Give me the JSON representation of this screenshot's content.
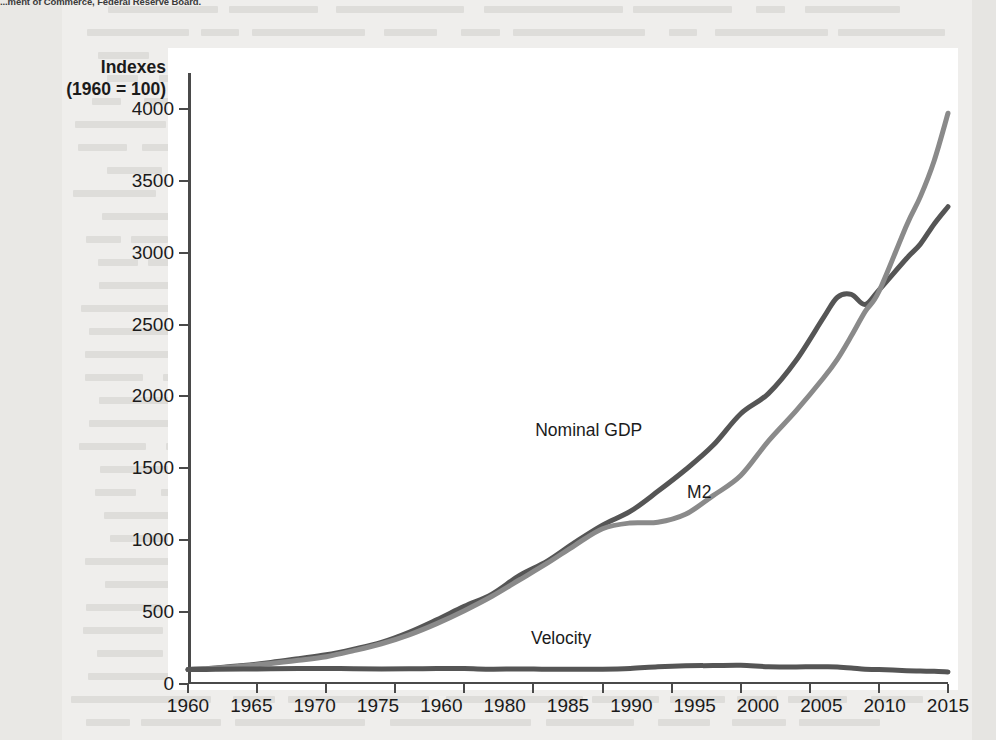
{
  "source_note": "...ment of Commerce, Federal Reserve Board.",
  "axis_caption": {
    "line1": "Indexes",
    "line2": "(1960 = 100)"
  },
  "colors": {
    "nominal_gdp": "#555555",
    "m2": "#8a8a8a",
    "velocity": "#555555",
    "axis": "#4a4a4a",
    "text": "#1b1b1b",
    "plate": "#ffffff",
    "page": "#efeeec"
  },
  "annotations": [
    {
      "name": "nominal-gdp-label",
      "text": "Nominal GDP",
      "x": 1989.0,
      "y": 1770
    },
    {
      "name": "m2-label",
      "text": "M2",
      "x": 1997.0,
      "y": 1335
    },
    {
      "name": "velocity-label",
      "text": "Velocity",
      "x": 1987.0,
      "y": 320
    }
  ],
  "chart_data": {
    "type": "line",
    "title": "",
    "subtitle": "",
    "xlabel": "",
    "ylabel": "Indexes (1960 = 100)",
    "xlim": [
      1960,
      2015
    ],
    "ylim": [
      0,
      4250
    ],
    "grid": false,
    "legend": "inline-annotations",
    "ytick_labels": [
      "0",
      "500",
      "1000",
      "1500",
      "2000",
      "2500",
      "3000",
      "3500",
      "4000"
    ],
    "yticks": [
      0,
      500,
      1000,
      1500,
      2000,
      2500,
      3000,
      3500,
      4000
    ],
    "xtick_labels": [
      "1960",
      "1965",
      "1970",
      "1975",
      "1960",
      "1980",
      "1985",
      "1990",
      "1995",
      "2000",
      "2005",
      "2010",
      "2015"
    ],
    "xticks": [
      1960,
      1965,
      1970,
      1975,
      1980,
      1985,
      1990,
      1995,
      2000,
      2005,
      2010,
      2015
    ],
    "xtick_note": "The fifth tick label is printed as 1960 in the source figure (apparent typo for an intermediate year).",
    "x": [
      1960,
      1962,
      1964,
      1966,
      1968,
      1970,
      1972,
      1974,
      1976,
      1978,
      1980,
      1982,
      1984,
      1986,
      1988,
      1990,
      1992,
      1994,
      1996,
      1998,
      2000,
      2002,
      2004,
      2006,
      2007,
      2008,
      2009,
      2010,
      2012,
      2013,
      2014,
      2015
    ],
    "series": [
      {
        "name": "Nominal GDP",
        "color": "#555555",
        "values": [
          100,
          112,
          128,
          150,
          176,
          203,
          243,
          290,
          360,
          447,
          540,
          625,
          755,
          855,
          985,
          1105,
          1200,
          1340,
          1490,
          1660,
          1880,
          2020,
          2250,
          2550,
          2690,
          2710,
          2640,
          2740,
          2960,
          3060,
          3200,
          3320
        ]
      },
      {
        "name": "M2",
        "color": "#8a8a8a",
        "values": [
          100,
          110,
          125,
          143,
          165,
          190,
          232,
          280,
          342,
          420,
          510,
          610,
          725,
          840,
          965,
          1080,
          1120,
          1125,
          1180,
          1310,
          1450,
          1690,
          1900,
          2130,
          2260,
          2420,
          2590,
          2730,
          3190,
          3390,
          3640,
          3970
        ]
      },
      {
        "name": "Velocity",
        "color": "#555555",
        "values": [
          100,
          102,
          104,
          106,
          108,
          108,
          106,
          105,
          106,
          107,
          107,
          103,
          105,
          102,
          103,
          103,
          108,
          120,
          127,
          128,
          130,
          120,
          119,
          120,
          119,
          112,
          102,
          100,
          93,
          90,
          88,
          84
        ]
      }
    ]
  }
}
